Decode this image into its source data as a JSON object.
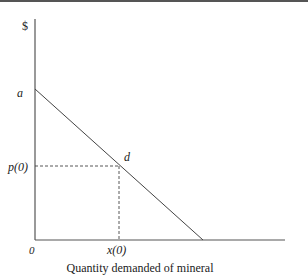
{
  "diagram": {
    "y_axis_label": "$",
    "x_axis_label": "Quantity demanded of mineral",
    "origin_label": "0",
    "intercept_label": "a",
    "point_label": "d",
    "price_label": "p(0)",
    "quantity_label": "x(0)",
    "colors": {
      "axis": "#555555",
      "line": "#444444",
      "dash": "#444444"
    }
  }
}
